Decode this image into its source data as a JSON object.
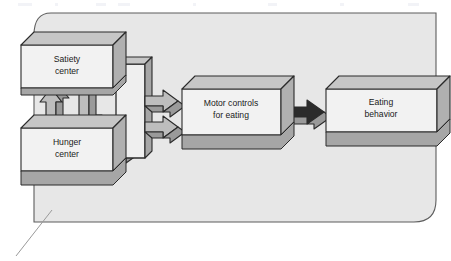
{
  "figure": {
    "kind": "flow-diagram",
    "panel": {
      "fill": "#e7e7e7",
      "stroke": "#5d5d5d"
    },
    "palette": {
      "box_face": "#f2f2f2",
      "box_top": "#c6c6c6",
      "box_side": "#b0b0b0",
      "box_bottom": "#a6a6a6",
      "arrow_face": "#bdbdbd",
      "arrow_shade": "#9a9a9a",
      "outline": "#2b2b2b",
      "leader_line": "#9a9a9a"
    }
  },
  "blocks": [
    {
      "id": "satiety-center",
      "line1": "Satiety",
      "line2": "center"
    },
    {
      "id": "hunger-center",
      "line1": "Hunger",
      "line2": "center"
    },
    {
      "id": "motor-controls",
      "line1": "Motor controls",
      "line2": "for eating"
    },
    {
      "id": "eating-behavior",
      "line1": "Eating",
      "line2": "behavior"
    }
  ],
  "connectors": [
    {
      "id": "hunger-to-satiety",
      "direction": "up",
      "style": "3d-block-arrow"
    },
    {
      "id": "satiety-to-hunger",
      "direction": "down",
      "style": "3d-block-arrow"
    },
    {
      "id": "satiety-to-bus",
      "direction": "right",
      "style": "3d-block-arrow"
    },
    {
      "id": "hunger-to-bus",
      "direction": "right",
      "style": "3d-block-arrow"
    },
    {
      "id": "bus-upper-to-motor",
      "direction": "right",
      "style": "3d-block-arrow"
    },
    {
      "id": "bus-lower-to-motor",
      "direction": "right",
      "style": "3d-block-arrow"
    },
    {
      "id": "motor-to-eating",
      "direction": "right",
      "style": "3d-block-arrow"
    }
  ]
}
